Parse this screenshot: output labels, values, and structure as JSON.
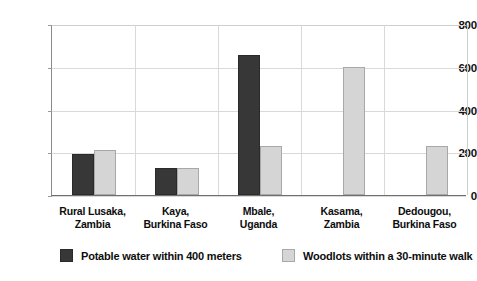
{
  "chart_data": {
    "type": "bar",
    "title": "",
    "subtitle": "",
    "xlabel": "",
    "ylabel": "",
    "ylim": [
      0,
      800
    ],
    "yticks": [
      0,
      200,
      400,
      600,
      800
    ],
    "ytick_labels": [
      "0",
      "200",
      "400",
      "600",
      "800"
    ],
    "grid": true,
    "legend_position": "bottom",
    "categories": [
      "Rural Lusaka, Zambia",
      "Kaya, Burkina Faso",
      "Mbale, Uganda",
      "Kasama, Zambia",
      "Dedougou, Burkina Faso"
    ],
    "category_lines": [
      [
        "Rural Lusaka,",
        "Zambia"
      ],
      [
        "Kaya,",
        "Burkina Faso"
      ],
      [
        "Mbale,",
        "Uganda"
      ],
      [
        "Kasama,",
        "Zambia"
      ],
      [
        "Dedougou,",
        "Burkina Faso"
      ]
    ],
    "series": [
      {
        "name": "Potable water within 400 meters",
        "color": "#373737",
        "values": [
          190,
          125,
          655,
          null,
          null
        ]
      },
      {
        "name": "Woodlots within a 30-minute walk",
        "color": "#d5d5d5",
        "values": [
          210,
          125,
          230,
          600,
          230
        ]
      }
    ]
  },
  "legend": {
    "items": [
      {
        "label": "Potable water within 400 meters",
        "swatch": "dark-swatch"
      },
      {
        "label": "Woodlots within a 30-minute walk",
        "swatch": "light-swatch"
      }
    ]
  },
  "colors": {
    "dark_series": "#373737",
    "light_series": "#d5d5d5",
    "gridline": "#d9d9d9",
    "axis": "#6f6f6f",
    "text": "#0d0d0d",
    "background": "#ffffff"
  }
}
